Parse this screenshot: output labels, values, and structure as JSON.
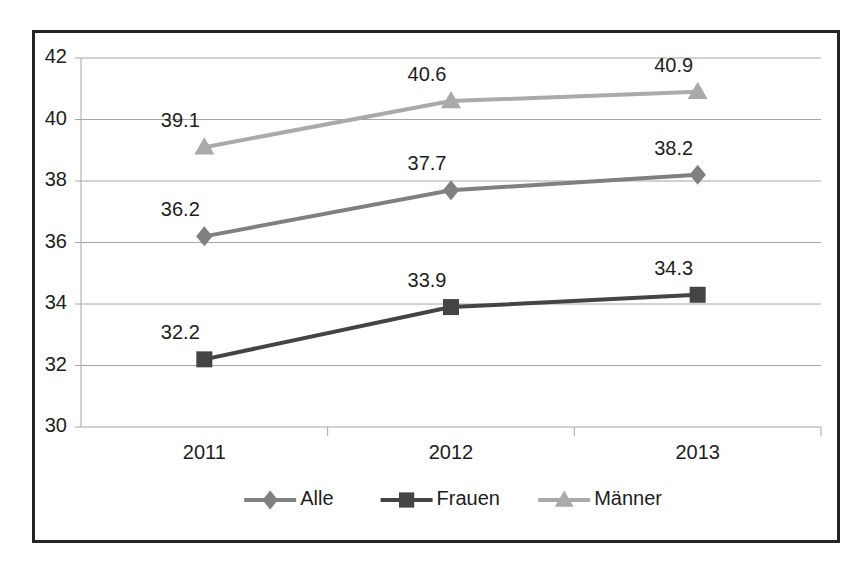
{
  "chart_data": {
    "type": "line",
    "title": "",
    "subtitle": "",
    "xlabel": "",
    "ylabel": "",
    "categories": [
      "2011",
      "2012",
      "2013"
    ],
    "series": [
      {
        "name": "Alle",
        "marker": "diamond",
        "color": "#808080",
        "values": [
          36.2,
          37.7,
          38.2
        ],
        "labels": [
          "36.2",
          "37.7",
          "38.2"
        ]
      },
      {
        "name": "Frauen",
        "marker": "square",
        "color": "#444444",
        "values": [
          32.2,
          33.9,
          34.3
        ],
        "labels": [
          "32.2",
          "33.9",
          "34.3"
        ]
      },
      {
        "name": "Männer",
        "marker": "triangle",
        "color": "#aaaaaa",
        "values": [
          39.1,
          40.6,
          40.9
        ],
        "labels": [
          "39.1",
          "40.6",
          "40.9"
        ]
      }
    ],
    "ylim": [
      30,
      42
    ],
    "yticks": [
      "30",
      "32",
      "34",
      "36",
      "38",
      "40",
      "42"
    ],
    "ytick_values": [
      30,
      32,
      34,
      36,
      38,
      40,
      42
    ],
    "grid": true,
    "legend_position": "bottom",
    "border_color": "#242424",
    "gridline_color": "#a6a6a6",
    "background_color": "#ffffff"
  },
  "legend": {
    "items": [
      {
        "label": "Alle",
        "marker": "diamond",
        "color": "#808080"
      },
      {
        "label": "Frauen",
        "marker": "square",
        "color": "#444444"
      },
      {
        "label": "Männer",
        "marker": "triangle",
        "color": "#aaaaaa"
      }
    ]
  }
}
